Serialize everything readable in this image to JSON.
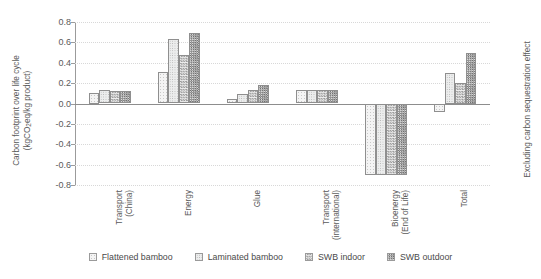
{
  "chart_data": {
    "type": "bar",
    "title": "",
    "categories": [
      "Transport (China)",
      "Energy",
      "Glue",
      "Transport (international)",
      "Bioenergy (End of Life)",
      "Total"
    ],
    "category_lines": [
      [
        "Transport",
        "(China)"
      ],
      [
        "Energy"
      ],
      [
        "Glue"
      ],
      [
        "Transport",
        "(international)"
      ],
      [
        "Bioenergy",
        "(End of Life)"
      ],
      [
        "Total"
      ]
    ],
    "series": [
      {
        "name": "Flattened bamboo",
        "values": [
          0.1,
          0.31,
          0.04,
          0.13,
          -0.7,
          -0.08
        ]
      },
      {
        "name": "Laminated bamboo",
        "values": [
          0.13,
          0.63,
          0.09,
          0.13,
          -0.7,
          0.3
        ]
      },
      {
        "name": "SWB indoor",
        "values": [
          0.12,
          0.48,
          0.13,
          0.13,
          -0.7,
          0.2
        ]
      },
      {
        "name": "SWB outdoor",
        "values": [
          0.12,
          0.69,
          0.18,
          0.13,
          -0.7,
          0.5
        ]
      }
    ],
    "xlabel": "",
    "ylabel": "Carbon footprint over life cycle (kgCO2eq/kg product)",
    "ylabel_line1": "Carbon footprint over life cycle",
    "ylabel_line2_pre": "(kgCO",
    "ylabel_line2_sub": "2",
    "ylabel_line2_post": "eq/kg product)",
    "ylim": [
      -0.8,
      0.8
    ],
    "yticks": [
      "0.8",
      "0.6",
      "0.4",
      "0.2",
      "0.0",
      "-0.2",
      "-0.4",
      "-0.6",
      "-0.8"
    ],
    "ytick_values": [
      0.8,
      0.6,
      0.4,
      0.2,
      0.0,
      -0.2,
      -0.4,
      -0.6,
      -0.8
    ],
    "grid": true,
    "legend_position": "bottom",
    "right_note": "Excluding carbon sequestration effect"
  },
  "legend": {
    "items": [
      {
        "label": "Flattened bamboo",
        "pattern": "light-dotted"
      },
      {
        "label": "Laminated bamboo",
        "pattern": "light-checker"
      },
      {
        "label": "SWB indoor",
        "pattern": "medium-checker"
      },
      {
        "label": "SWB outdoor",
        "pattern": "dense-checker"
      }
    ]
  }
}
